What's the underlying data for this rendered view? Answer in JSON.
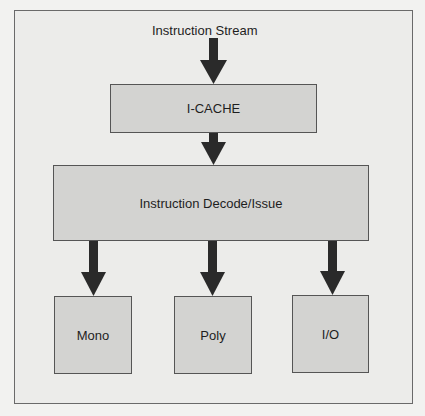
{
  "diagram": {
    "input_label": "Instruction Stream",
    "nodes": {
      "icache": "I-CACHE",
      "decode": "Instruction Decode/Issue",
      "mono": "Mono",
      "poly": "Poly",
      "io": "I/O"
    },
    "edges": [
      {
        "from": "Instruction Stream",
        "to": "I-CACHE"
      },
      {
        "from": "I-CACHE",
        "to": "Instruction Decode/Issue"
      },
      {
        "from": "Instruction Decode/Issue",
        "to": "Mono"
      },
      {
        "from": "Instruction Decode/Issue",
        "to": "Poly"
      },
      {
        "from": "Instruction Decode/Issue",
        "to": "I/O"
      }
    ],
    "colors": {
      "background": "#ececea",
      "box_fill": "#d3d3d1",
      "border": "#555555",
      "arrow": "#2a2a2a"
    }
  }
}
